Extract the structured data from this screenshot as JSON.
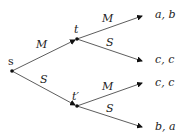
{
  "diagram": {
    "type": "game-tree",
    "nodes": {
      "root": {
        "label": "s"
      },
      "upper": {
        "label": "t"
      },
      "lower": {
        "label": "t′"
      }
    },
    "edges": {
      "root_upper": {
        "label": "M"
      },
      "root_lower": {
        "label": "S"
      },
      "upper_1": {
        "label": "M"
      },
      "upper_2": {
        "label": "S"
      },
      "lower_1": {
        "label": "M"
      },
      "lower_2": {
        "label": "S"
      }
    },
    "payoffs": [
      "a, b",
      "c, c",
      "c, c",
      "b, a"
    ]
  }
}
